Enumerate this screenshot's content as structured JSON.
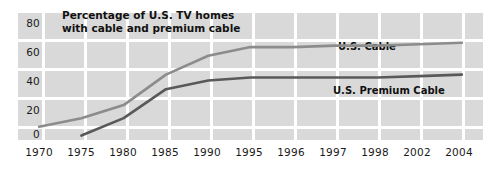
{
  "chart_data": {
    "type": "line",
    "title": "Percentage of U.S. TV homes\nwith cable and premium cable",
    "xlabel": "",
    "ylabel": "",
    "grid": true,
    "legend_position": "inline-annotation",
    "background_color": "#d9d9d9",
    "gridline_color": "#ffffff",
    "ylim": [
      0,
      80
    ],
    "yticks": [
      0,
      20,
      40,
      60,
      80
    ],
    "categories": [
      "1970",
      "1975",
      "1980",
      "1985",
      "1990",
      "1995",
      "1996",
      "1997",
      "1998",
      "2002",
      "2004"
    ],
    "series": [
      {
        "name": "U.S. Cable",
        "color": "#8c8c8c",
        "values": [
          7,
          13,
          22,
          43,
          56,
          62,
          62,
          63,
          63,
          64,
          65
        ]
      },
      {
        "name": "U.S. Premium Cable",
        "color": "#595959",
        "values": [
          null,
          1,
          13,
          33,
          39,
          41,
          41,
          41,
          41,
          42,
          43
        ]
      }
    ],
    "annotations": [
      {
        "text": "U.S. Cable",
        "series": "U.S. Cable"
      },
      {
        "text": "U.S. Premium Cable",
        "series": "U.S. Premium Cable"
      }
    ]
  },
  "axes": {
    "y_labels": [
      "80",
      "60",
      "40",
      "20",
      "0"
    ],
    "x_labels": [
      "1970",
      "1975",
      "1980",
      "1985",
      "1990",
      "1995",
      "1996",
      "1997",
      "1998",
      "2002",
      "2004"
    ]
  },
  "labels": {
    "us_cable": "U.S. Cable",
    "us_premium_cable": "U.S. Premium Cable"
  }
}
